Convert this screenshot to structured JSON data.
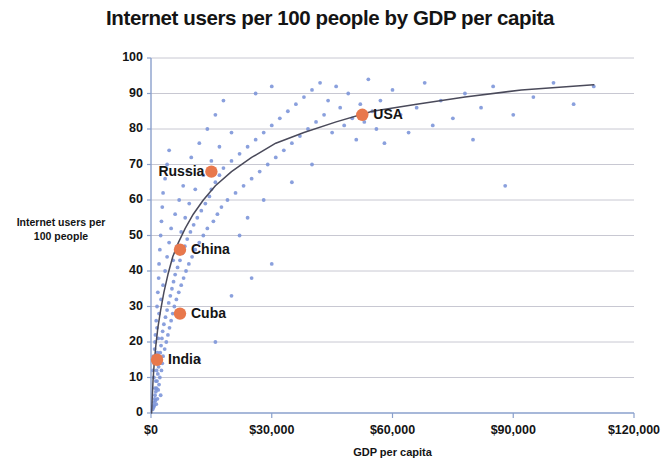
{
  "chart_data": {
    "type": "scatter",
    "title": "Internet users per 100 people by GDP per capita",
    "xlabel": "GDP per capita",
    "ylabel": "Internet users per 100 people",
    "ylabel_line1": "Internet users per",
    "ylabel_line2": "100 people",
    "xlim": [
      0,
      120000
    ],
    "ylim": [
      0,
      100
    ],
    "xticks": [
      0,
      30000,
      60000,
      90000,
      120000
    ],
    "xtick_labels": [
      "$0",
      "$30,000",
      "$60,000",
      "$90,000",
      "$120,000"
    ],
    "yticks": [
      0,
      10,
      20,
      30,
      40,
      50,
      60,
      70,
      80,
      90,
      100
    ],
    "ytick_labels": [
      "0",
      "10",
      "20",
      "30",
      "40",
      "50",
      "60",
      "70",
      "80",
      "90",
      "100"
    ],
    "grid": "horizontal",
    "legend": "none",
    "colors": {
      "scatter": "#7a93d8",
      "highlight": "#e8784c",
      "trendline": "#4a4a5a",
      "gridline": "#c8c8d2",
      "axis": "#8aa0cc"
    },
    "series": [
      {
        "name": "Countries",
        "marker": "small-blue-dot",
        "points": [
          [
            400,
            1
          ],
          [
            500,
            2
          ],
          [
            600,
            1.5
          ],
          [
            700,
            3
          ],
          [
            800,
            2
          ],
          [
            900,
            4
          ],
          [
            1000,
            5
          ],
          [
            1100,
            3.5
          ],
          [
            1200,
            6
          ],
          [
            1300,
            2.5
          ],
          [
            1400,
            7
          ],
          [
            1500,
            9
          ],
          [
            1600,
            4
          ],
          [
            1700,
            11
          ],
          [
            1800,
            6.5
          ],
          [
            1900,
            13
          ],
          [
            2000,
            8
          ],
          [
            2100,
            15
          ],
          [
            2200,
            10
          ],
          [
            2300,
            17
          ],
          [
            2400,
            5
          ],
          [
            2500,
            19
          ],
          [
            2600,
            12
          ],
          [
            2700,
            21
          ],
          [
            2800,
            14
          ],
          [
            2900,
            23
          ],
          [
            3000,
            16
          ],
          [
            3200,
            25
          ],
          [
            3400,
            18
          ],
          [
            3600,
            27
          ],
          [
            3800,
            20
          ],
          [
            4000,
            29
          ],
          [
            4200,
            22
          ],
          [
            4400,
            31
          ],
          [
            4600,
            24
          ],
          [
            4800,
            33
          ],
          [
            5000,
            26
          ],
          [
            5200,
            35
          ],
          [
            5400,
            28
          ],
          [
            5600,
            37
          ],
          [
            5800,
            30
          ],
          [
            6000,
            39
          ],
          [
            6300,
            32
          ],
          [
            6600,
            41
          ],
          [
            6900,
            34
          ],
          [
            7200,
            43
          ],
          [
            7500,
            36
          ],
          [
            7800,
            45
          ],
          [
            8100,
            38
          ],
          [
            8400,
            47
          ],
          [
            8700,
            40
          ],
          [
            9000,
            49
          ],
          [
            9400,
            42
          ],
          [
            9800,
            51
          ],
          [
            10200,
            44
          ],
          [
            10600,
            53
          ],
          [
            11000,
            46
          ],
          [
            11500,
            55
          ],
          [
            12000,
            48
          ],
          [
            12500,
            57
          ],
          [
            13000,
            50
          ],
          [
            13500,
            59
          ],
          [
            14000,
            52
          ],
          [
            14500,
            61
          ],
          [
            15000,
            63
          ],
          [
            15500,
            54
          ],
          [
            16000,
            65
          ],
          [
            16500,
            56
          ],
          [
            17000,
            67
          ],
          [
            17500,
            58
          ],
          [
            18000,
            69
          ],
          [
            19000,
            60
          ],
          [
            20000,
            71
          ],
          [
            21000,
            62
          ],
          [
            22000,
            73
          ],
          [
            23000,
            64
          ],
          [
            24000,
            75
          ],
          [
            25000,
            66
          ],
          [
            26000,
            77
          ],
          [
            27000,
            68
          ],
          [
            28000,
            79
          ],
          [
            29000,
            70
          ],
          [
            30000,
            81
          ],
          [
            31000,
            72
          ],
          [
            32000,
            83
          ],
          [
            33000,
            74
          ],
          [
            34000,
            85
          ],
          [
            35000,
            76
          ],
          [
            36000,
            87
          ],
          [
            37000,
            78
          ],
          [
            38000,
            89
          ],
          [
            39000,
            80
          ],
          [
            40000,
            91
          ],
          [
            41000,
            82
          ],
          [
            42000,
            93
          ],
          [
            43000,
            84
          ],
          [
            44000,
            88
          ],
          [
            45000,
            79
          ],
          [
            46000,
            92
          ],
          [
            47000,
            86
          ],
          [
            48000,
            81
          ],
          [
            49000,
            90
          ],
          [
            50000,
            83
          ],
          [
            51000,
            77
          ],
          [
            52000,
            87
          ],
          [
            53000,
            82
          ],
          [
            54000,
            94
          ],
          [
            55000,
            85
          ],
          [
            56000,
            80
          ],
          [
            57000,
            88
          ],
          [
            58000,
            76
          ],
          [
            60000,
            91
          ],
          [
            62000,
            84
          ],
          [
            64000,
            79
          ],
          [
            66000,
            86
          ],
          [
            68000,
            93
          ],
          [
            70000,
            81
          ],
          [
            72000,
            88
          ],
          [
            75000,
            83
          ],
          [
            78000,
            90
          ],
          [
            80000,
            77
          ],
          [
            82000,
            86
          ],
          [
            85000,
            92
          ],
          [
            88000,
            64
          ],
          [
            90000,
            84
          ],
          [
            95000,
            89
          ],
          [
            100000,
            93
          ],
          [
            105000,
            87
          ],
          [
            110000,
            92
          ],
          [
            1000,
            20
          ],
          [
            1500,
            24
          ],
          [
            2000,
            28
          ],
          [
            2500,
            32
          ],
          [
            3000,
            36
          ],
          [
            3500,
            40
          ],
          [
            4000,
            44
          ],
          [
            4500,
            48
          ],
          [
            5000,
            52
          ],
          [
            5500,
            43
          ],
          [
            6000,
            56
          ],
          [
            6500,
            47
          ],
          [
            7000,
            60
          ],
          [
            7500,
            51
          ],
          [
            8000,
            64
          ],
          [
            8500,
            55
          ],
          [
            9000,
            68
          ],
          [
            9500,
            59
          ],
          [
            10000,
            72
          ],
          [
            11000,
            63
          ],
          [
            12000,
            76
          ],
          [
            13000,
            67
          ],
          [
            14000,
            80
          ],
          [
            15000,
            71
          ],
          [
            16000,
            84
          ],
          [
            17000,
            75
          ],
          [
            18000,
            88
          ],
          [
            20000,
            79
          ],
          [
            22000,
            50
          ],
          [
            24000,
            55
          ],
          [
            26000,
            90
          ],
          [
            28000,
            60
          ],
          [
            30000,
            92
          ],
          [
            35000,
            65
          ],
          [
            40000,
            70
          ],
          [
            12000,
            15
          ],
          [
            16000,
            20
          ],
          [
            20000,
            33
          ],
          [
            25000,
            38
          ],
          [
            30000,
            42
          ],
          [
            500,
            12
          ],
          [
            600,
            16
          ],
          [
            700,
            10
          ],
          [
            800,
            14
          ],
          [
            900,
            18
          ],
          [
            1000,
            7
          ],
          [
            1100,
            22
          ],
          [
            1200,
            9
          ],
          [
            1300,
            26
          ],
          [
            1400,
            12
          ],
          [
            1500,
            30
          ],
          [
            1600,
            17
          ],
          [
            1700,
            34
          ],
          [
            1800,
            21
          ],
          [
            1900,
            38
          ],
          [
            2000,
            42
          ],
          [
            2200,
            46
          ],
          [
            2400,
            50
          ],
          [
            2600,
            54
          ],
          [
            2800,
            58
          ],
          [
            3000,
            62
          ],
          [
            3500,
            66
          ],
          [
            4000,
            70
          ],
          [
            4500,
            74
          ]
        ]
      }
    ],
    "highlighted_points": [
      {
        "name": "India",
        "x": 1500,
        "y": 15,
        "label_side": "right"
      },
      {
        "name": "Cuba",
        "x": 7200,
        "y": 28,
        "label_side": "right"
      },
      {
        "name": "China",
        "x": 7200,
        "y": 46,
        "label_side": "right"
      },
      {
        "name": "Russia",
        "x": 15000,
        "y": 68,
        "label_side": "left"
      },
      {
        "name": "USA",
        "x": 52500,
        "y": 84,
        "label_side": "right"
      }
    ],
    "trendline": {
      "description": "logarithmic best-fit curve",
      "points": [
        [
          150,
          0
        ],
        [
          300,
          4
        ],
        [
          500,
          9
        ],
        [
          800,
          14
        ],
        [
          1200,
          19
        ],
        [
          1700,
          24
        ],
        [
          2400,
          29
        ],
        [
          3200,
          34
        ],
        [
          4200,
          39
        ],
        [
          5400,
          44
        ],
        [
          6800,
          48
        ],
        [
          8500,
          52
        ],
        [
          10500,
          56
        ],
        [
          13000,
          60
        ],
        [
          16000,
          64
        ],
        [
          20000,
          68
        ],
        [
          25000,
          72
        ],
        [
          31000,
          76
        ],
        [
          38000,
          79
        ],
        [
          46000,
          82
        ],
        [
          55000,
          85
        ],
        [
          66000,
          87
        ],
        [
          78000,
          89
        ],
        [
          92000,
          91
        ],
        [
          110000,
          92.5
        ]
      ]
    }
  }
}
